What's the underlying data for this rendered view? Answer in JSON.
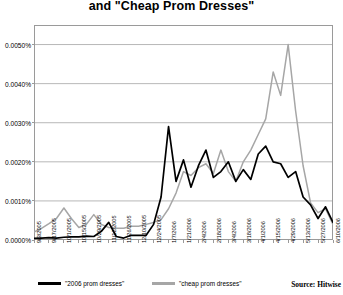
{
  "title": "and \"Cheap Prom Dresses\"",
  "source_note": "Source: Hitwise",
  "legend": {
    "series_1_label": "\"2006 prom dresses\"",
    "series_2_label": "\"cheap prom dresses\""
  },
  "colors": {
    "series_1": "#000000",
    "series_2": "#a6a6a6",
    "grid": "#9a9a9a",
    "frame": "#9a9a9a",
    "background": "#ffffff"
  },
  "chart_data": {
    "type": "line",
    "title": "and \"Cheap Prom Dresses\"",
    "xlabel": "",
    "ylabel": "",
    "ylim": [
      0.0,
      0.0055
    ],
    "yticks": [
      0.0,
      0.001,
      0.002,
      0.003,
      0.004,
      0.005
    ],
    "ytick_labels": [
      "0.0000%",
      "0.0010%",
      "0.0020%",
      "0.0030%",
      "0.0040%",
      "0.0050%"
    ],
    "grid": true,
    "legend_position": "bottom",
    "categories": [
      "9/3/2005",
      "9/10/2005",
      "9/17/2005",
      "9/24/2005",
      "10/1/2005",
      "10/8/2005",
      "10/15/2005",
      "10/22/2005",
      "10/29/2005",
      "11/5/2005",
      "11/12/2005",
      "11/19/2005",
      "11/26/2005",
      "12/3/2005",
      "12/10/2005",
      "12/17/2005",
      "12/24/2005",
      "12/31/2005",
      "1/7/2006",
      "1/14/2006",
      "1/21/2006",
      "1/28/2006",
      "2/4/2006",
      "2/11/2006",
      "2/18/2006",
      "2/25/2006",
      "3/4/2006",
      "3/11/2006",
      "3/18/2006",
      "3/25/2006",
      "4/1/2006",
      "4/8/2006",
      "4/15/2006",
      "4/22/2006",
      "4/29/2006",
      "5/6/2006",
      "5/13/2006",
      "5/20/2006",
      "5/27/2006",
      "6/3/2006",
      "6/10/2006"
    ],
    "xtick_labels": [
      "9/3/2005",
      "9/17/2005",
      "10/1/2005",
      "10/15/2005",
      "10/29/2005",
      "11/12/2005",
      "11/26/2005",
      "12/10/2005",
      "12/24/2005",
      "1/7/2006",
      "1/21/2006",
      "2/4/2006",
      "2/18/2006",
      "3/4/2006",
      "3/18/2006",
      "4/1/2006",
      "4/15/2006",
      "4/29/2006",
      "5/13/2006",
      "5/27/2006",
      "6/10/2006"
    ],
    "series": [
      {
        "name": "\"2006 prom dresses\"",
        "color": "#000000",
        "values": [
          4e-05,
          5e-05,
          6e-05,
          5e-05,
          7e-05,
          8e-05,
          8e-05,
          0.0001,
          9e-05,
          0.00022,
          0.00045,
          9e-05,
          5e-05,
          0.00012,
          0.00012,
          0.00012,
          0.0004,
          0.0011,
          0.0029,
          0.0015,
          0.00205,
          0.00135,
          0.0019,
          0.0023,
          0.0016,
          0.00175,
          0.002,
          0.0015,
          0.0018,
          0.00155,
          0.0022,
          0.0024,
          0.002,
          0.00195,
          0.0016,
          0.00175,
          0.0011,
          0.0009,
          0.00055,
          0.00085,
          0.00045
        ]
      },
      {
        "name": "\"cheap prom dresses\"",
        "color": "#a6a6a6",
        "values": [
          0.0002,
          0.0003,
          0.00042,
          0.00055,
          0.00082,
          0.00055,
          0.00032,
          0.0004,
          0.00065,
          0.0004,
          0.00032,
          0.0003,
          0.0003,
          0.00035,
          0.00035,
          0.0004,
          0.00045,
          0.00052,
          0.0008,
          0.0012,
          0.00175,
          0.00165,
          0.00185,
          0.00195,
          0.0017,
          0.0023,
          0.00175,
          0.0015,
          0.002,
          0.0023,
          0.0027,
          0.0031,
          0.0043,
          0.0037,
          0.005,
          0.0033,
          0.0019,
          0.00095,
          0.0007,
          0.0008,
          0.0004
        ]
      }
    ]
  }
}
